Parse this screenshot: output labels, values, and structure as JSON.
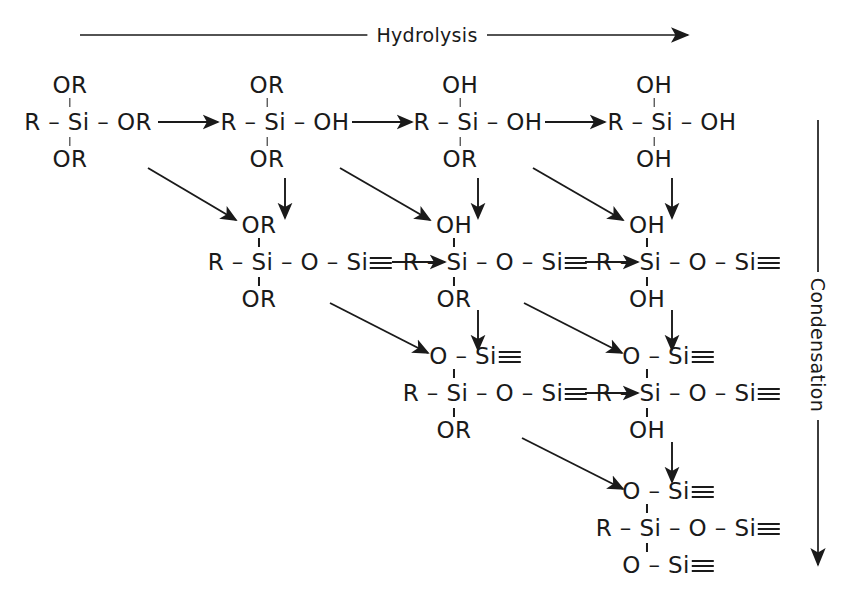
{
  "figure": {
    "background_color": "#ffffff",
    "ink_color": "#1a1a1a",
    "width": 854,
    "height": 594
  },
  "pathways": {
    "horizontal": {
      "label": "Hydrolysis",
      "direction": "left-to-right",
      "meaning": "OR groups replaced by OH"
    },
    "vertical": {
      "label": "Condensation",
      "direction": "top-to-bottom",
      "meaning": "Si-O-Si siloxane bridges formed"
    }
  },
  "glyphs": {
    "bond": "–",
    "triple_bond": "≡",
    "arrow": "→"
  },
  "molecules": [
    {
      "id": "m-r1c1",
      "row": 1,
      "col": 1,
      "x": 88,
      "y": 122,
      "top": "OR",
      "core_left": "R – Si – ",
      "core_right": "OR",
      "core_right_triple": false,
      "bottom": "OR",
      "bottom_triple": false,
      "name": "trialkoxysilane"
    },
    {
      "id": "m-r1c2",
      "row": 1,
      "col": 2,
      "x": 285,
      "y": 122,
      "top": "OR",
      "core_left": "R – Si – ",
      "core_right": "OH",
      "core_right_triple": false,
      "bottom": "OR",
      "bottom_triple": false,
      "name": "mono-hydrolysed silane"
    },
    {
      "id": "m-r1c3",
      "row": 1,
      "col": 3,
      "x": 478,
      "y": 122,
      "top": "OH",
      "core_left": "R – Si – ",
      "core_right": "OH",
      "core_right_triple": false,
      "bottom": "OR",
      "bottom_triple": false,
      "name": "di-hydrolysed silane"
    },
    {
      "id": "m-r1c4",
      "row": 1,
      "col": 4,
      "x": 672,
      "y": 122,
      "top": "OH",
      "core_left": "R – Si – ",
      "core_right": "OH",
      "core_right_triple": false,
      "bottom": "OH",
      "bottom_triple": false,
      "name": "silanetriol"
    },
    {
      "id": "m-r2c2",
      "row": 2,
      "col": 2,
      "x": 300,
      "y": 262,
      "top": "OR",
      "core_left": "R – Si – O – Si",
      "core_right": "",
      "core_right_triple": true,
      "bottom": "OR",
      "bottom_triple": false,
      "name": "siloxane dimer, dialkoxy"
    },
    {
      "id": "m-r2c3",
      "row": 2,
      "col": 3,
      "x": 495,
      "y": 262,
      "top": "OH",
      "core_left": "R – Si – O – Si",
      "core_right": "",
      "core_right_triple": true,
      "bottom": "OR",
      "bottom_triple": false,
      "name": "siloxane dimer, hydroxy alkoxy"
    },
    {
      "id": "m-r2c4",
      "row": 2,
      "col": 4,
      "x": 688,
      "y": 262,
      "top": "OH",
      "core_left": "R – Si – O – Si",
      "core_right": "",
      "core_right_triple": true,
      "bottom": "OH",
      "bottom_triple": false,
      "name": "siloxane dimer, dihydroxy"
    },
    {
      "id": "m-r3c3",
      "row": 3,
      "col": 3,
      "x": 495,
      "y": 393,
      "top": "O – Si",
      "top_triple": true,
      "core_left": "R – Si – O – Si",
      "core_right": "",
      "core_right_triple": true,
      "bottom": "OR",
      "bottom_triple": false,
      "name": "branched siloxane, alkoxy"
    },
    {
      "id": "m-r3c4",
      "row": 3,
      "col": 4,
      "x": 688,
      "y": 393,
      "top": "O – Si",
      "top_triple": true,
      "core_left": "R – Si – O – Si",
      "core_right": "",
      "core_right_triple": true,
      "bottom": "OH",
      "bottom_triple": false,
      "name": "branched siloxane, hydroxy"
    },
    {
      "id": "m-r4c4",
      "row": 4,
      "col": 4,
      "x": 688,
      "y": 528,
      "top": "O – Si",
      "top_triple": true,
      "core_left": "R – Si – O – Si",
      "core_right": "",
      "core_right_triple": true,
      "bottom": "O – Si",
      "bottom_triple": true,
      "name": "fully condensed T3 silsesquioxane unit"
    }
  ],
  "arrows": {
    "horizontal": [
      {
        "id": "a-h-r1-1",
        "x1": 158,
        "y1": 122,
        "x2": 222,
        "y2": 122
      },
      {
        "id": "a-h-r1-2",
        "x1": 352,
        "y1": 122,
        "x2": 416,
        "y2": 122
      },
      {
        "id": "a-h-r1-3",
        "x1": 545,
        "y1": 122,
        "x2": 609,
        "y2": 122
      },
      {
        "id": "a-h-r2-1",
        "x1": 389,
        "y1": 262,
        "x2": 447,
        "y2": 262
      },
      {
        "id": "a-h-r2-2",
        "x1": 582,
        "y1": 262,
        "x2": 640,
        "y2": 262
      },
      {
        "id": "a-h-r3-1",
        "x1": 582,
        "y1": 393,
        "x2": 640,
        "y2": 393
      }
    ],
    "vertical": [
      {
        "id": "a-v-c2",
        "x1": 285,
        "y1": 175,
        "x2": 285,
        "y2": 221
      },
      {
        "id": "a-v-c3",
        "x1": 478,
        "y1": 175,
        "x2": 478,
        "y2": 221
      },
      {
        "id": "a-v-c4",
        "x1": 672,
        "y1": 175,
        "x2": 672,
        "y2": 221
      },
      {
        "id": "a-v-c3b",
        "x1": 478,
        "y1": 305,
        "x2": 478,
        "y2": 352
      },
      {
        "id": "a-v-c4b",
        "x1": 672,
        "y1": 305,
        "x2": 672,
        "y2": 352
      },
      {
        "id": "a-v-c4c",
        "x1": 672,
        "y1": 437,
        "x2": 672,
        "y2": 484
      }
    ],
    "diagonal": [
      {
        "id": "a-d-1",
        "x1": 148,
        "y1": 168,
        "x2": 240,
        "y2": 223
      },
      {
        "id": "a-d-2",
        "x1": 340,
        "y1": 168,
        "x2": 434,
        "y2": 223
      },
      {
        "id": "a-d-3",
        "x1": 533,
        "y1": 168,
        "x2": 627,
        "y2": 223
      },
      {
        "id": "a-d-4",
        "x1": 330,
        "y1": 303,
        "x2": 432,
        "y2": 356
      },
      {
        "id": "a-d-5",
        "x1": 524,
        "y1": 303,
        "x2": 626,
        "y2": 356
      },
      {
        "id": "a-d-6",
        "x1": 522,
        "y1": 438,
        "x2": 627,
        "y2": 492
      }
    ],
    "pathway_axes": [
      {
        "id": "axis-hydrolysis",
        "orientation": "horizontal",
        "x1": 80,
        "y1": 35,
        "x2": 690,
        "y2": 35
      },
      {
        "id": "axis-condensation",
        "orientation": "vertical",
        "x1": 818,
        "y1": 120,
        "x2": 818,
        "y2": 570
      }
    ]
  }
}
